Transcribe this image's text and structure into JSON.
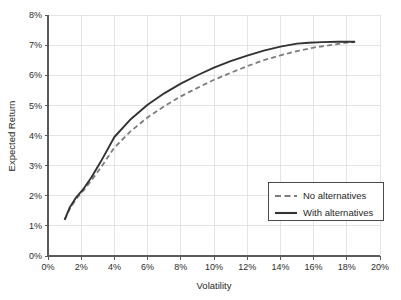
{
  "chart_data": {
    "type": "line",
    "title": "",
    "xlabel": "Volatility",
    "ylabel": "Expected Return",
    "xlim": [
      0,
      20
    ],
    "ylim": [
      0,
      8
    ],
    "grid": true,
    "legend_position": "lower-right",
    "x_tick_labels": [
      "0%",
      "2%",
      "4%",
      "6%",
      "8%",
      "10%",
      "12%",
      "14%",
      "16%",
      "18%",
      "20%"
    ],
    "x_tick_values": [
      0,
      2,
      4,
      6,
      8,
      10,
      12,
      14,
      16,
      18,
      20
    ],
    "y_tick_labels": [
      "0%",
      "1%",
      "2%",
      "3%",
      "4%",
      "5%",
      "6%",
      "7%",
      "8%"
    ],
    "y_tick_values": [
      0,
      1,
      2,
      3,
      4,
      5,
      6,
      7,
      8
    ],
    "series": [
      {
        "name": "No alternatives",
        "style": "dashed",
        "color": "#7d7d7d",
        "x": [
          1.0,
          1.3,
          1.7,
          2.1,
          2.6,
          3.2,
          4.0,
          5.0,
          6.0,
          7.0,
          8.0,
          9.0,
          10.0,
          11.0,
          12.0,
          13.0,
          14.0,
          15.0,
          16.0,
          17.0,
          18.0,
          18.5
        ],
        "y": [
          1.2,
          1.55,
          1.9,
          2.15,
          2.5,
          2.95,
          3.6,
          4.15,
          4.6,
          4.97,
          5.3,
          5.58,
          5.85,
          6.08,
          6.3,
          6.5,
          6.66,
          6.8,
          6.92,
          7.0,
          7.08,
          7.1
        ]
      },
      {
        "name": "With alternatives",
        "style": "solid",
        "color": "#333333",
        "x": [
          1.0,
          1.3,
          1.7,
          2.1,
          2.6,
          3.2,
          4.0,
          5.0,
          6.0,
          7.0,
          8.0,
          9.0,
          10.0,
          11.0,
          12.0,
          13.0,
          14.0,
          15.0,
          15.7,
          16.5,
          17.5,
          18.5
        ],
        "y": [
          1.2,
          1.6,
          1.95,
          2.2,
          2.6,
          3.15,
          3.95,
          4.55,
          5.02,
          5.4,
          5.72,
          6.0,
          6.25,
          6.47,
          6.65,
          6.82,
          6.95,
          7.05,
          7.08,
          7.1,
          7.11,
          7.11
        ]
      }
    ],
    "legend_entries": [
      {
        "label": "No alternatives",
        "style": "dashed",
        "color": "#7d7d7d"
      },
      {
        "label": "With alternatives",
        "style": "solid",
        "color": "#333333"
      }
    ]
  }
}
